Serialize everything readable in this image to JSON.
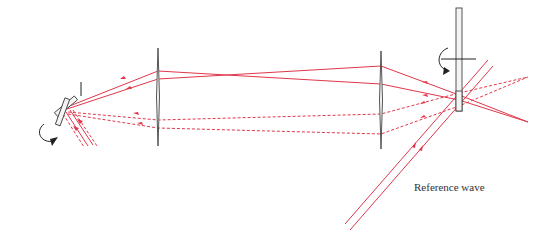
{
  "diagram": {
    "title": "",
    "labels": {
      "reference_wave": "Reference wave"
    },
    "colors": {
      "ray": "#e0374a",
      "optic_outline": "#444444",
      "text": "#333333",
      "background": "#ffffff"
    },
    "components": [
      {
        "id": "scanning-mirror",
        "type": "rotating-mirror",
        "x": 63,
        "y": 112
      },
      {
        "id": "aperture",
        "type": "aperture-stop",
        "x": 81,
        "y1": 82,
        "y2": 96
      },
      {
        "id": "lens-1",
        "type": "lens",
        "x": 158,
        "y1": 48,
        "y2": 146
      },
      {
        "id": "lens-2",
        "type": "lens",
        "x": 381,
        "y1": 51,
        "y2": 149
      },
      {
        "id": "hologram-plate",
        "type": "rotating-plate",
        "x": 459,
        "y1": 8,
        "y2": 111
      },
      {
        "id": "reference-beam",
        "type": "reference-wave"
      }
    ],
    "rays": {
      "solid": "object beam (mirror position 1)",
      "dashed": "object beam (mirror position 2)"
    }
  }
}
